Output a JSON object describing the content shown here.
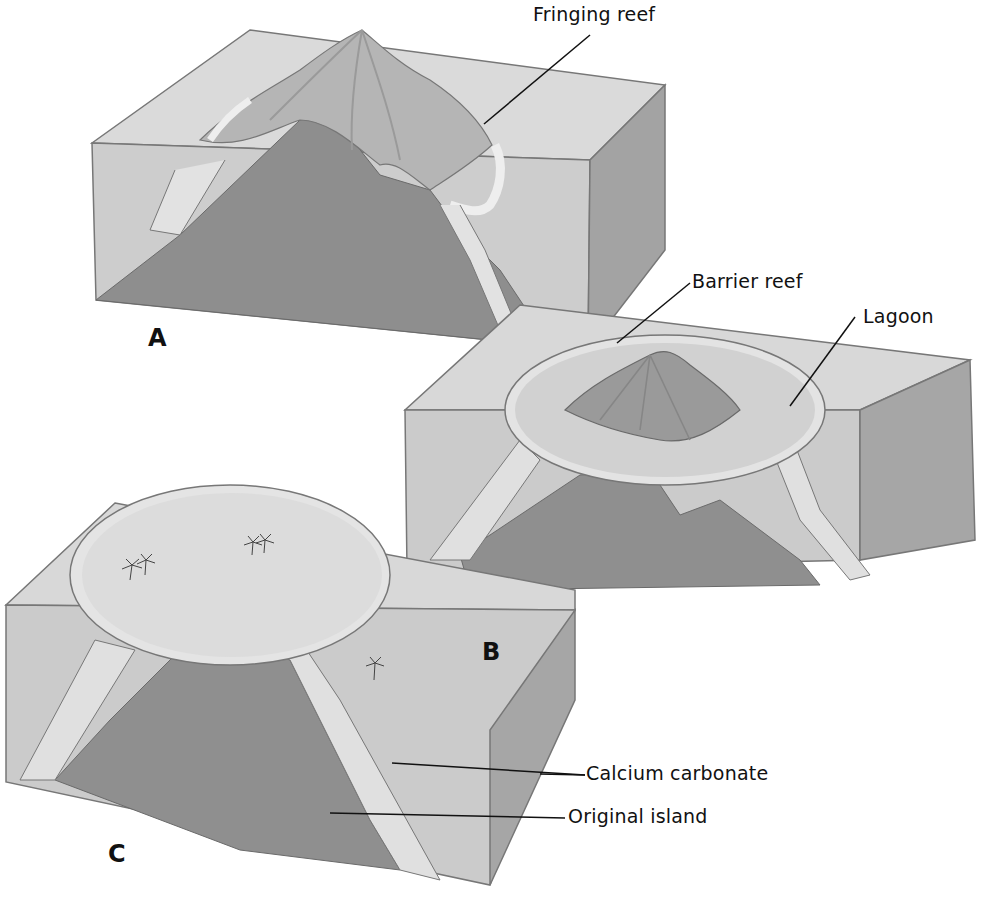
{
  "figure": {
    "panels": [
      {
        "id": "A",
        "letter": "A",
        "stage": "Fringing reef around volcanic island"
      },
      {
        "id": "B",
        "letter": "B",
        "stage": "Barrier reef with lagoon around sinking island"
      },
      {
        "id": "C",
        "letter": "C",
        "stage": "Atoll with lagoon; original island submerged"
      }
    ],
    "labels": {
      "fringing_reef": "Fringing reef",
      "barrier_reef": "Barrier reef",
      "lagoon": "Lagoon",
      "calcium_carbonate": "Calcium carbonate",
      "original_island": "Original island"
    },
    "colors": {
      "background": "#ffffff",
      "water_top": "#d9d9d9",
      "water_front": "#cfcfcf",
      "water_side": "#a9a9a9",
      "island_rock": "#8f8f8f",
      "reef_carbonate": "#dedede",
      "outline": "#6e6e6e",
      "text": "#111111"
    }
  }
}
